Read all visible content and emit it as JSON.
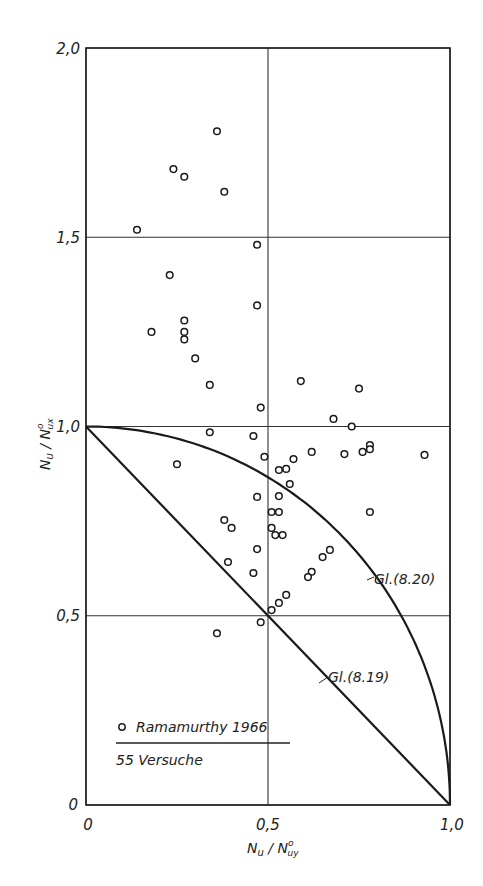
{
  "chart_data": {
    "type": "scatter",
    "title": "",
    "xlabel": "N_u / N°_uy",
    "ylabel": "N_u / N°_ux",
    "xlim": [
      0,
      1.0
    ],
    "ylim": [
      0,
      2.0
    ],
    "grid": true,
    "x_ticks": [
      "0",
      "0,5",
      "1,0"
    ],
    "y_ticks": [
      "0",
      "0,5",
      "1,0",
      "1,5",
      "2,0"
    ],
    "x_tick_values": [
      0,
      0.5,
      1.0
    ],
    "y_tick_values": [
      0,
      0.5,
      1.0,
      1.5,
      2.0
    ],
    "legend": {
      "marker": "open-circle",
      "label": "Ramamurthy 1966",
      "sublabel": "55 Versuche",
      "position": "lower-left"
    },
    "series": [
      {
        "name": "Ramamurthy 1966",
        "marker": "open-circle",
        "points": [
          [
            0.36,
            1.78
          ],
          [
            0.24,
            1.68
          ],
          [
            0.27,
            1.66
          ],
          [
            0.38,
            1.62
          ],
          [
            0.14,
            1.52
          ],
          [
            0.47,
            1.48
          ],
          [
            0.23,
            1.4
          ],
          [
            0.47,
            1.32
          ],
          [
            0.18,
            1.25
          ],
          [
            0.27,
            1.28
          ],
          [
            0.27,
            1.25
          ],
          [
            0.27,
            1.23
          ],
          [
            0.3,
            1.18
          ],
          [
            0.34,
            1.11
          ],
          [
            0.59,
            1.12
          ],
          [
            0.75,
            1.1
          ],
          [
            0.48,
            1.05
          ],
          [
            0.68,
            1.02
          ],
          [
            0.73,
            1.0
          ],
          [
            0.34,
            0.985
          ],
          [
            0.46,
            0.975
          ],
          [
            0.25,
            0.9
          ],
          [
            0.49,
            0.92
          ],
          [
            0.53,
            0.885
          ],
          [
            0.55,
            0.888
          ],
          [
            0.57,
            0.914
          ],
          [
            0.62,
            0.933
          ],
          [
            0.71,
            0.927
          ],
          [
            0.76,
            0.933
          ],
          [
            0.78,
            0.951
          ],
          [
            0.78,
            0.94
          ],
          [
            0.93,
            0.925
          ],
          [
            0.56,
            0.848
          ],
          [
            0.47,
            0.814
          ],
          [
            0.53,
            0.816
          ],
          [
            0.51,
            0.774
          ],
          [
            0.53,
            0.774
          ],
          [
            0.78,
            0.774
          ],
          [
            0.38,
            0.753
          ],
          [
            0.4,
            0.732
          ],
          [
            0.51,
            0.732
          ],
          [
            0.52,
            0.713
          ],
          [
            0.54,
            0.713
          ],
          [
            0.67,
            0.674
          ],
          [
            0.65,
            0.655
          ],
          [
            0.47,
            0.676
          ],
          [
            0.39,
            0.642
          ],
          [
            0.62,
            0.616
          ],
          [
            0.61,
            0.602
          ],
          [
            0.46,
            0.613
          ],
          [
            0.55,
            0.555
          ],
          [
            0.53,
            0.534
          ],
          [
            0.51,
            0.515
          ],
          [
            0.48,
            0.483
          ],
          [
            0.36,
            0.454
          ]
        ]
      }
    ],
    "curves": [
      {
        "name": "Gl. (8.19)",
        "label": "Gl.(8.19)",
        "equation": "x + y = 1",
        "type": "line",
        "from": [
          0,
          1
        ],
        "to": [
          1,
          0
        ]
      },
      {
        "name": "Gl. (8.20)",
        "label": "Gl.(8.20)",
        "equation": "x^2 + y^2 = 1",
        "type": "quarter-circle",
        "from": [
          0,
          1
        ],
        "to": [
          1,
          0
        ]
      }
    ]
  },
  "labels": {
    "x_axis": "N",
    "x_axis_sub": "u",
    "x_axis_den": "N",
    "x_axis_den_sup": "o",
    "x_axis_den_sub": "uy",
    "y_axis_sub_den": "ux",
    "curve_819": "Gl.(8.19)",
    "curve_820": "Gl.(8.20)",
    "legend_label": "Ramamurthy 1966",
    "legend_count": "55 Versuche",
    "tick_x0": "0",
    "tick_x05": "0,5",
    "tick_x1": "1,0",
    "tick_y0": "0",
    "tick_y05": "0,5",
    "tick_y1": "1,0",
    "tick_y15": "1,5",
    "tick_y2": "2,0"
  }
}
